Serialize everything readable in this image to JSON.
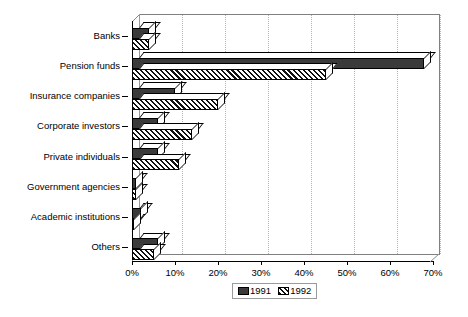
{
  "chart_data": {
    "type": "bar",
    "orientation": "horizontal",
    "style": "3d-grouped-bar",
    "title": "",
    "subtitle": "",
    "xlabel": "",
    "ylabel": "",
    "categories": [
      "Banks",
      "Pension funds",
      "Insurance companies",
      "Corporate investors",
      "Private individuals",
      "Government agencies",
      "Academic institutions",
      "Others"
    ],
    "series": [
      {
        "name": "1991",
        "fill": "solid-dark",
        "color": "#3a3a3a",
        "values": [
          4,
          68,
          10,
          6,
          6,
          1,
          2,
          6
        ]
      },
      {
        "name": "1992",
        "fill": "diagonal-hatch",
        "color": "#111111",
        "values": [
          4,
          45,
          20,
          14,
          11,
          1,
          0.5,
          5
        ]
      }
    ],
    "xlim": [
      0,
      70
    ],
    "xticks": [
      0,
      10,
      20,
      30,
      40,
      50,
      60,
      70
    ],
    "xticklabels": [
      "0%",
      "10%",
      "20%",
      "30%",
      "40%",
      "50%",
      "60%",
      "70%"
    ],
    "grid": true,
    "grid_axis": "x",
    "legend": {
      "position": "bottom-center",
      "entries": [
        "1991",
        "1992"
      ]
    },
    "unit": "%"
  },
  "legend": {
    "items": [
      {
        "label": "1991"
      },
      {
        "label": "1992"
      }
    ]
  }
}
